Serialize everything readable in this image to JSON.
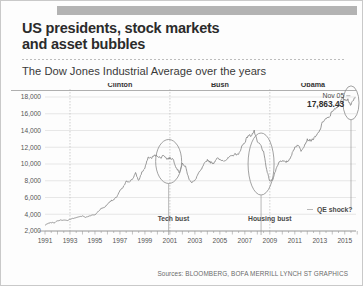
{
  "header": {
    "title_line1": "US presidents, stock markets",
    "title_line2": "and asset bubbles",
    "subtitle": "The Dow Jones Industrial Average over the years"
  },
  "source": "Sources: BLOOMBERG, BOFA MERRILL LYNCH  ST GRAPHICS",
  "colors": {
    "line": "#7a7a7a",
    "grid": "#dddddd",
    "divider": "#bbbbbb",
    "topbar": "#b3b3b3",
    "text": "#2b2b2b"
  },
  "chart_data": {
    "type": "line",
    "title": "The Dow Jones Industrial Average over the years",
    "xlabel": "",
    "ylabel": "",
    "xlim": [
      1991,
      2015.9
    ],
    "ylim": [
      2000,
      18000
    ],
    "yticks": [
      2000,
      4000,
      6000,
      8000,
      10000,
      12000,
      14000,
      16000,
      18000
    ],
    "ytick_labels": [
      "2,000",
      "4,000",
      "6,000",
      "8,000",
      "10,000",
      "12,000",
      "14,000",
      "16,000",
      "18,000"
    ],
    "xticks": [
      1991,
      1993,
      1995,
      1997,
      1999,
      2001,
      2003,
      2005,
      2007,
      2009,
      2011,
      2013,
      2015
    ],
    "xtick_labels": [
      "1991",
      "1993",
      "1995",
      "1997",
      "1999",
      "2001",
      "2003",
      "2005",
      "2007",
      "2009",
      "2011",
      "2013",
      "2015"
    ],
    "grid": true,
    "legend": "none",
    "series": [
      {
        "name": "Dow Jones Industrial Average",
        "x": [
          1991.0,
          1991.25,
          1991.5,
          1991.75,
          1992.0,
          1992.25,
          1992.5,
          1992.75,
          1993.0,
          1993.25,
          1993.5,
          1993.75,
          1994.0,
          1994.25,
          1994.5,
          1994.75,
          1995.0,
          1995.25,
          1995.5,
          1995.75,
          1996.0,
          1996.25,
          1996.5,
          1996.75,
          1997.0,
          1997.25,
          1997.5,
          1997.75,
          1998.0,
          1998.25,
          1998.5,
          1998.75,
          1999.0,
          1999.25,
          1999.5,
          1999.75,
          2000.0,
          2000.25,
          2000.5,
          2000.75,
          2001.0,
          2001.25,
          2001.5,
          2001.75,
          2002.0,
          2002.25,
          2002.5,
          2002.75,
          2003.0,
          2003.25,
          2003.5,
          2003.75,
          2004.0,
          2004.25,
          2004.5,
          2004.75,
          2005.0,
          2005.25,
          2005.5,
          2005.75,
          2006.0,
          2006.25,
          2006.5,
          2006.75,
          2007.0,
          2007.25,
          2007.5,
          2007.75,
          2008.0,
          2008.25,
          2008.5,
          2008.75,
          2009.0,
          2009.25,
          2009.5,
          2009.75,
          2010.0,
          2010.25,
          2010.5,
          2010.75,
          2011.0,
          2011.25,
          2011.5,
          2011.75,
          2012.0,
          2012.25,
          2012.5,
          2012.75,
          2013.0,
          2013.25,
          2013.5,
          2013.75,
          2014.0,
          2014.25,
          2014.5,
          2014.75,
          2015.0,
          2015.25,
          2015.5,
          2015.75,
          2015.85
        ],
        "values": [
          2700,
          2900,
          3000,
          3000,
          3200,
          3300,
          3300,
          3250,
          3400,
          3500,
          3600,
          3700,
          3800,
          3650,
          3750,
          3900,
          3950,
          4300,
          4700,
          4800,
          5200,
          5600,
          5700,
          6100,
          6800,
          7200,
          7900,
          7900,
          8200,
          8900,
          8000,
          9000,
          9500,
          10800,
          10700,
          11000,
          11000,
          10700,
          11100,
          10600,
          10700,
          10600,
          9600,
          9000,
          10000,
          9700,
          8300,
          7800,
          8000,
          8800,
          9300,
          10000,
          10500,
          10200,
          10100,
          10700,
          10500,
          10400,
          10500,
          10800,
          11000,
          11200,
          11100,
          12100,
          12600,
          13400,
          13400,
          13900,
          12600,
          12300,
          11400,
          9300,
          7900,
          8200,
          9400,
          10300,
          10400,
          10200,
          10400,
          11100,
          12000,
          12300,
          11600,
          12200,
          12900,
          12800,
          13000,
          13400,
          14000,
          15100,
          15400,
          15500,
          16400,
          16500,
          17000,
          17800,
          17800,
          17700,
          17000,
          17800,
          17863
        ],
        "final_value": 17863.43,
        "final_label": "17,863.43",
        "final_date": "Nov 05"
      }
    ],
    "annotations": [
      {
        "name": "tech-bust",
        "label": "Tech bust",
        "x_center": 2000.9,
        "y_center": 10300,
        "note": "ellipse marking dot-com crash"
      },
      {
        "name": "housing-bust",
        "label": "Housing bust",
        "x_center": 2008.3,
        "y_center": 10000,
        "note": "ellipse marking financial crisis"
      },
      {
        "name": "qe-shock",
        "label": "QE shock?",
        "x_center": 2015.5,
        "y_center": 17300,
        "note": "ellipse marking recent volatility"
      },
      {
        "name": "latest-value",
        "date": "Nov 05",
        "value": "17,863.43"
      }
    ],
    "president_terms": [
      {
        "name": "Clinton",
        "start": 1993,
        "end": 2001
      },
      {
        "name": "Bush",
        "start": 2001,
        "end": 2009
      },
      {
        "name": "Obama",
        "start": 2009,
        "end": 2015.9
      }
    ]
  }
}
